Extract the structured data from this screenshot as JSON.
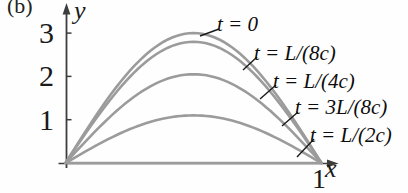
{
  "figure_label": "(b)",
  "colors": {
    "curve": "#9b9b9b",
    "axis": "#3d3d3d",
    "leader": "#1a1a1a",
    "text": "#111111"
  },
  "chart_data": {
    "type": "line",
    "title": "",
    "xlabel": "x",
    "ylabel": "y",
    "xlim": [
      0,
      1.08
    ],
    "ylim": [
      0,
      3.4
    ],
    "x_ticks": [
      1
    ],
    "y_ticks": [
      1,
      2,
      3
    ],
    "grid": false,
    "legend_position": "labels-on-curves",
    "curve_model": "y = amplitude * sin(pi * x) for x in [0,1]",
    "series": [
      {
        "name": "t = 0",
        "amplitude": 3.0
      },
      {
        "name": "t = L/(8c)",
        "amplitude": 2.8
      },
      {
        "name": "t = L/(4c)",
        "amplitude": 2.05
      },
      {
        "name": "t = 3L/(8c)",
        "amplitude": 1.1
      },
      {
        "name": "t = L/(2c)",
        "amplitude": 0.0
      }
    ]
  }
}
